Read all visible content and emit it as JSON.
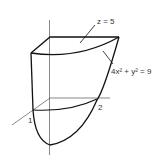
{
  "labels": {
    "top_plane": "z = 5",
    "surface": "4x² + y² = 9",
    "x_tick": "1",
    "y_tick": "2"
  },
  "colors": {
    "stroke": "#111111",
    "axis": "#444444",
    "text": "#333333"
  }
}
